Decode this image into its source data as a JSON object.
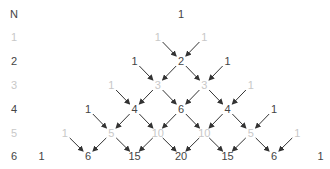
{
  "diagram": {
    "row_label_header": "N",
    "rows": [
      {
        "n": "N",
        "values": [
          "1"
        ],
        "style": "dark"
      },
      {
        "n": "1",
        "values": [
          "1",
          "1"
        ],
        "style": "light"
      },
      {
        "n": "2",
        "values": [
          "1",
          "2",
          "1"
        ],
        "style": "dark"
      },
      {
        "n": "3",
        "values": [
          "1",
          "3",
          "3",
          "1"
        ],
        "style": "light"
      },
      {
        "n": "4",
        "values": [
          "1",
          "4",
          "6",
          "4",
          "1"
        ],
        "style": "dark"
      },
      {
        "n": "5",
        "values": [
          "1",
          "5",
          "10",
          "10",
          "5",
          "1"
        ],
        "style": "light"
      },
      {
        "n": "6",
        "values": [
          "1",
          "6",
          "15",
          "20",
          "15",
          "6",
          "1"
        ],
        "style": "dark"
      }
    ],
    "colors": {
      "dark": "#444444",
      "light": "#c8c8c8",
      "arrow": "#333333"
    }
  }
}
